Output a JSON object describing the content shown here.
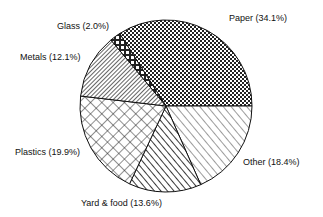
{
  "chart_data": {
    "type": "pie",
    "title": "",
    "slices": [
      {
        "label": "Paper",
        "value": 34.1,
        "pattern": "dense-crosshatch"
      },
      {
        "label": "Other",
        "value": 18.4,
        "pattern": "diagonal-sparse"
      },
      {
        "label": "Yard & food",
        "value": 13.6,
        "pattern": "diagonal-bold"
      },
      {
        "label": "Plastics",
        "value": 19.9,
        "pattern": "diamond-crosshatch"
      },
      {
        "label": "Metals",
        "value": 12.1,
        "pattern": "diagonal-dense"
      },
      {
        "label": "Glass",
        "value": 2.0,
        "pattern": "checker"
      }
    ],
    "legend": "none (direct labels)"
  },
  "labels": {
    "paper": "Paper (34.1%)",
    "other": "Other (18.4%)",
    "yard": "Yard & food (13.6%)",
    "plastics": "Plastics (19.9%)",
    "metals": "Metals (12.1%)",
    "glass": "Glass (2.0%)"
  }
}
